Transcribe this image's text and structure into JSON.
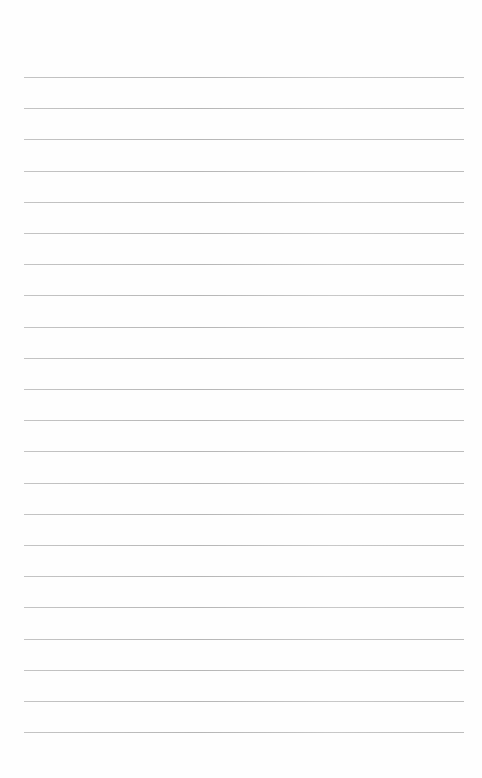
{
  "page": {
    "type": "blank ruled notebook page",
    "ruled_lines": {
      "count": 22,
      "first_y": 77,
      "spacing": 31.2,
      "left": 24,
      "width": 440,
      "color": "#bdbdbd"
    },
    "background": "#fefefe",
    "show_through_text": ""
  }
}
